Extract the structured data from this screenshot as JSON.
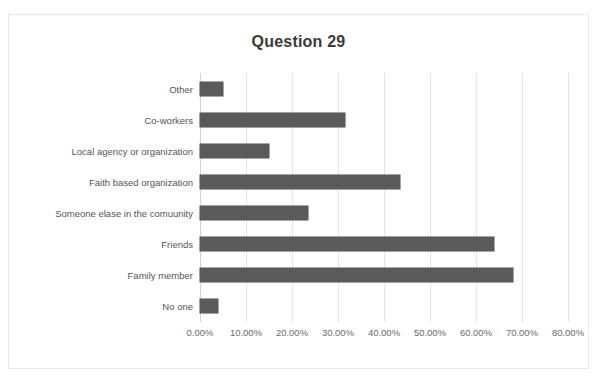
{
  "chart_data": {
    "type": "bar",
    "orientation": "horizontal",
    "title": "Question 29",
    "xlabel": "",
    "ylabel": "",
    "xlim": [
      0,
      80
    ],
    "grid": true,
    "legend": false,
    "bar_color": "#5a5a5a",
    "tick_labels": [
      "0.00%",
      "10.00%",
      "20.00%",
      "30.00%",
      "40.00%",
      "50.00%",
      "60.00%",
      "70.00%",
      "80.00%"
    ],
    "tick_values": [
      0,
      10,
      20,
      30,
      40,
      50,
      60,
      70,
      80
    ],
    "categories": [
      "Other",
      "Co-workers",
      "Local agency or organization",
      "Faith based organization",
      "Someone elase in the comuunity",
      "Friends",
      "Family member",
      "No one"
    ],
    "values": [
      5.0,
      31.5,
      15.0,
      43.5,
      23.5,
      64.0,
      68.0,
      4.0
    ],
    "value_labels": [
      "5.00%",
      "31.50%",
      "15.00%",
      "43.50%",
      "23.50%",
      "64.00%",
      "68.00%",
      "4.00%"
    ]
  }
}
